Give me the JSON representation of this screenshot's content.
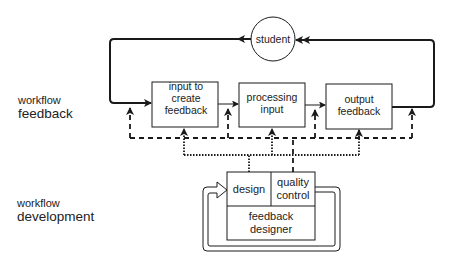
{
  "lanes": {
    "feedback": {
      "line1": "workflow",
      "line2": "feedback"
    },
    "development": {
      "line1": "workflow",
      "line2": "development"
    }
  },
  "nodes": {
    "student": "student",
    "input": "input to create feedback",
    "processing": "processing input",
    "output": "output feedback",
    "design": "design",
    "quality_control": "quality control",
    "feedback_designer": "feedback designer"
  },
  "colors": {
    "stroke": "#1a1a1a",
    "text": "#222222",
    "background": "#ffffff"
  }
}
